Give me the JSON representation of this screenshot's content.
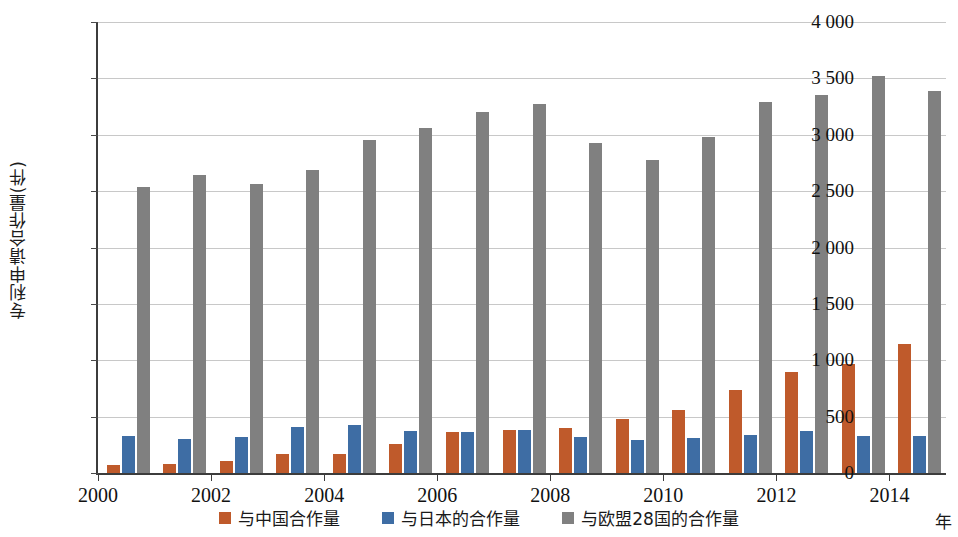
{
  "chart_data": {
    "type": "bar",
    "title": "",
    "xlabel": "年",
    "ylabel": "专利申请合作量(件)",
    "ylim": [
      0,
      4000
    ],
    "ytick_step": 500,
    "ytick_labels": [
      "0",
      "500",
      "1 000",
      "1 500",
      "2 000",
      "2 500",
      "3 000",
      "3 500",
      "4 000"
    ],
    "ytick_values": [
      0,
      500,
      1000,
      1500,
      2000,
      2500,
      3000,
      3500,
      4000
    ],
    "grid": true,
    "legend_position": "bottom",
    "categories": [
      2000,
      2001,
      2002,
      2003,
      2004,
      2005,
      2006,
      2007,
      2008,
      2009,
      2010,
      2011,
      2012,
      2013,
      2014
    ],
    "xtick_labels": [
      "2000",
      "2002",
      "2004",
      "2006",
      "2008",
      "2010",
      "2012",
      "2014"
    ],
    "xtick_values": [
      2000,
      2002,
      2004,
      2006,
      2008,
      2010,
      2012,
      2014
    ],
    "series": [
      {
        "name": "与中国合作量",
        "color": "#bf5a2b",
        "values": [
          70,
          80,
          105,
          165,
          165,
          255,
          360,
          385,
          400,
          475,
          555,
          735,
          900,
          965,
          1140
        ]
      },
      {
        "name": "与日本的合作量",
        "color": "#3e6da4",
        "values": [
          330,
          300,
          320,
          405,
          425,
          375,
          365,
          385,
          320,
          295,
          310,
          335,
          375,
          330,
          330
        ]
      },
      {
        "name": "与欧盟28国的合作量",
        "color": "#808080",
        "values": [
          2540,
          2640,
          2565,
          2690,
          2955,
          3060,
          3205,
          3270,
          2925,
          2780,
          2980,
          3295,
          3350,
          3520,
          3390
        ]
      }
    ]
  }
}
